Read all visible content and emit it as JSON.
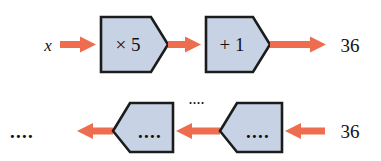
{
  "diagram": {
    "type": "function-machine-flow",
    "colors": {
      "arrow": "#ee6d4f",
      "machine_fill": "#c7d3e5",
      "machine_stroke": "#1c1c1c",
      "text": "#111111",
      "background": "#ffffff"
    },
    "rows": [
      {
        "id": "forward-row",
        "direction": "left-to-right",
        "input_label": "x",
        "output_label": "36",
        "machines": [
          {
            "id": "machine-times-5",
            "label": "× 5",
            "point_direction": "right"
          },
          {
            "id": "machine-plus-1",
            "label": "+ 1",
            "point_direction": "right"
          }
        ],
        "arrows": [
          {
            "id": "arrow-forward-1",
            "direction": "right"
          },
          {
            "id": "arrow-forward-2",
            "direction": "right"
          },
          {
            "id": "arrow-forward-3",
            "direction": "right"
          }
        ]
      },
      {
        "id": "inverse-row",
        "direction": "right-to-left",
        "input_label": "36",
        "output_label": "....",
        "mid_label": "....",
        "machines": [
          {
            "id": "machine-inverse-left",
            "label": "....",
            "point_direction": "left"
          },
          {
            "id": "machine-inverse-right",
            "label": "....",
            "point_direction": "left"
          }
        ],
        "arrows": [
          {
            "id": "arrow-inverse-1",
            "direction": "left"
          },
          {
            "id": "arrow-inverse-2",
            "direction": "left"
          },
          {
            "id": "arrow-inverse-3",
            "direction": "left"
          }
        ]
      }
    ]
  }
}
